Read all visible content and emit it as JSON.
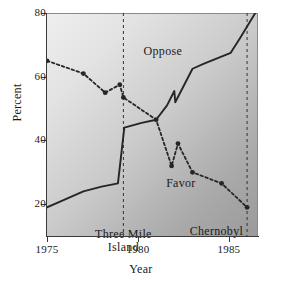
{
  "chart_data": {
    "type": "line",
    "title": "",
    "xlabel": "Year",
    "ylabel": "Percent",
    "xlim": [
      1975,
      1986.6
    ],
    "ylim": [
      10,
      80
    ],
    "grid": false,
    "legend_position": "inline-labels",
    "xticks": [
      1975,
      1980,
      1985
    ],
    "xticklabels": [
      "1975",
      "1980",
      "1985"
    ],
    "yticks": [
      20,
      40,
      60,
      80
    ],
    "yticklabels": [
      "20",
      "40",
      "60",
      "80"
    ],
    "series": [
      {
        "name": "Oppose",
        "style": "solid",
        "markers": false,
        "color": "#262626",
        "x": [
          1975,
          1976,
          1977,
          1978,
          1978.9,
          1979.25,
          1980.2,
          1981,
          1981.6,
          1982.0,
          1982.05,
          1983,
          1983.6,
          1985.1,
          1985.6,
          1986.45
        ],
        "y": [
          19,
          21.5,
          24,
          25.5,
          26.5,
          44,
          45.5,
          46.5,
          51,
          55.5,
          52,
          62.5,
          64,
          67.5,
          72,
          80
        ]
      },
      {
        "name": "Favor",
        "style": "dashed",
        "markers": true,
        "color": "#262626",
        "x": [
          1975,
          1977,
          1978.2,
          1979.0,
          1979.2,
          1981,
          1981.85,
          1982.2,
          1983,
          1984.6,
          1986.0
        ],
        "y": [
          65,
          61,
          55,
          57.5,
          53.5,
          46.5,
          32,
          39,
          30,
          26.5,
          19
        ]
      }
    ],
    "annotations": [
      {
        "text": "Oppose",
        "x": 1982.4,
        "y": 68
      },
      {
        "text": "Favor",
        "x": 1983.2,
        "y": 26.5
      }
    ],
    "event_lines": [
      {
        "label": "Three Mile Island",
        "label_line1": "Three Mile",
        "label_line2": "Island",
        "x": 1979.2,
        "style": "dashed"
      },
      {
        "label": "Chernobyl",
        "label_line1": "Chernobyl",
        "label_line2": "",
        "x": 1986.0,
        "style": "dashed"
      }
    ]
  }
}
